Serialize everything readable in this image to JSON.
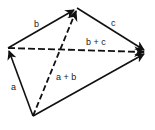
{
  "diagram": {
    "colors": {
      "stroke": "#111111",
      "background": "#ffffff"
    },
    "points": {
      "O": [
        33,
        116
      ],
      "P": [
        8,
        48
      ],
      "Q": [
        77,
        8
      ],
      "R": [
        147,
        52
      ]
    },
    "vectors": [
      {
        "id": "a",
        "from": "O",
        "to": "P",
        "style": "solid",
        "label": "a"
      },
      {
        "id": "b",
        "from": "P",
        "to": "Q",
        "style": "solid",
        "label": "b"
      },
      {
        "id": "c",
        "from": "Q",
        "to": "R",
        "style": "solid",
        "label": "c"
      },
      {
        "id": "a_plus_b",
        "from": "O",
        "to": "Q",
        "style": "dashed",
        "label": "a + b"
      },
      {
        "id": "b_plus_c",
        "from": "P",
        "to": "R",
        "style": "dashed",
        "label": "b + c"
      },
      {
        "id": "sum",
        "from": "O",
        "to": "R",
        "style": "solid",
        "label": ""
      }
    ],
    "labels": {
      "a": "a",
      "b": "b",
      "c": "c",
      "a_plus_b": "a + b",
      "b_plus_c": "b + c"
    }
  }
}
